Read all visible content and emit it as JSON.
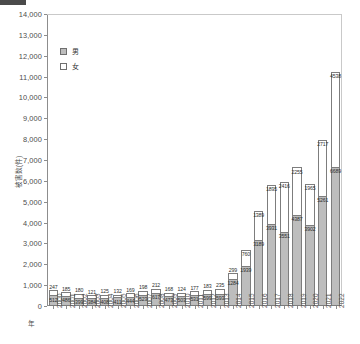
{
  "chart_data": {
    "type": "bar",
    "stacked": true,
    "title": "",
    "xlabel": "年",
    "ylabel": "被害数(件)",
    "ylim": [
      0,
      14000
    ],
    "ytick_step": 1000,
    "ytick_labels": [
      "0",
      "1,000",
      "2,000",
      "3,000",
      "4,000",
      "5,000",
      "6,000",
      "7,000",
      "8,000",
      "9,000",
      "10,000",
      "11,000",
      "12,000",
      "13,000",
      "14,000"
    ],
    "grid": false,
    "legend_position": "upper-left-inside",
    "categories": [
      "2000",
      "2001",
      "2002",
      "2003",
      "2004",
      "2005",
      "2006",
      "2007",
      "2008",
      "2009",
      "2010",
      "2011",
      "2012",
      "2013",
      "2014",
      "2015",
      "2016",
      "2017",
      "2018",
      "2019",
      "2020",
      "2021",
      "2022"
    ],
    "series": [
      {
        "name": "男",
        "color": "#bdbdbd",
        "values": [
          512,
          486,
          399,
          384,
          408,
          411,
          444,
          523,
          617,
          473,
          503,
          531,
          599,
          593,
          1284,
          1939,
          3189,
          3931,
          3551,
          4387,
          3902,
          5261,
          6689
        ]
      },
      {
        "name": "女",
        "color": "#ffffff",
        "values": [
          247,
          185,
          180,
          121,
          125,
          132,
          169,
          198,
          212,
          168,
          124,
          177,
          183,
          235,
          299,
          760,
          1389,
          1895,
          2416,
          2255,
          1965,
          2717,
          4538
        ]
      }
    ]
  },
  "legend": {
    "items": [
      {
        "label": "男",
        "swatch": "male"
      },
      {
        "label": "女",
        "swatch": "female"
      }
    ]
  },
  "axes": {
    "y_title": "被害数(件)",
    "x_title": "年"
  }
}
